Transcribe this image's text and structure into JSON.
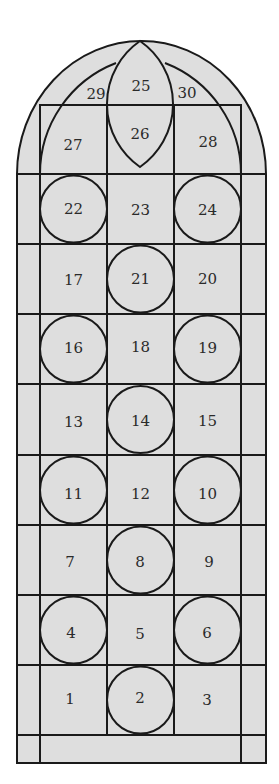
{
  "diagram": {
    "type": "stained-glass-window-panel-layout",
    "colors": {
      "glass": "#dedede",
      "lead": "#1a1a1a",
      "text": "#2a2a2a",
      "background": "#ffffff"
    },
    "tracery": {
      "lens_upper": "25",
      "lens_lower": "26",
      "left_spandrel": "29",
      "right_spandrel": "30",
      "left_arch_panel": "27",
      "right_arch_panel": "28"
    },
    "rows": [
      {
        "cells": [
          "22",
          "23",
          "24"
        ],
        "circles": [
          true,
          false,
          true
        ]
      },
      {
        "cells": [
          "17",
          "21",
          "20"
        ],
        "circles": [
          false,
          true,
          false
        ]
      },
      {
        "cells": [
          "16",
          "18",
          "19"
        ],
        "circles": [
          true,
          false,
          true
        ]
      },
      {
        "cells": [
          "13",
          "14",
          "15"
        ],
        "circles": [
          false,
          true,
          false
        ]
      },
      {
        "cells": [
          "11",
          "12",
          "10"
        ],
        "circles": [
          true,
          false,
          true
        ]
      },
      {
        "cells": [
          "7",
          "8",
          "9"
        ],
        "circles": [
          false,
          true,
          false
        ]
      },
      {
        "cells": [
          "4",
          "5",
          "6"
        ],
        "circles": [
          true,
          false,
          true
        ]
      },
      {
        "cells": [
          "1",
          "2",
          "3"
        ],
        "circles": [
          false,
          true,
          false
        ]
      }
    ]
  }
}
